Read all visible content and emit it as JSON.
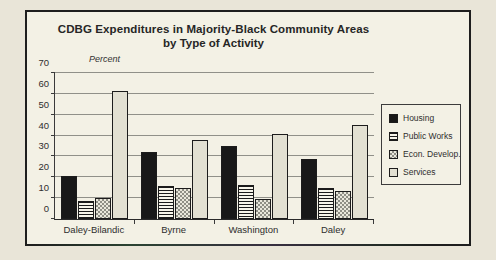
{
  "chart_data": {
    "type": "bar",
    "title": "CDBG Expenditures in Majority-Black Community Areas",
    "subtitle": "by Type of Activity",
    "ylabel": "Percent",
    "xlabel": "",
    "ylim": [
      0,
      70
    ],
    "yticks": [
      70,
      60,
      50,
      40,
      30,
      20,
      10,
      0
    ],
    "grid": "horizontal",
    "legend_position": "right",
    "categories": [
      "Daley-Bilandic",
      "Byrne",
      "Washington",
      "Daley"
    ],
    "series": [
      {
        "name": "Housing",
        "pattern": "solid-black",
        "values": [
          20.5,
          32,
          35,
          29
        ]
      },
      {
        "name": "Public Works",
        "pattern": "h-stripes",
        "values": [
          8.5,
          16,
          16.5,
          15
        ]
      },
      {
        "name": "Econ. Develop.",
        "pattern": "checker",
        "values": [
          10,
          15,
          9.5,
          13.5
        ]
      },
      {
        "name": "Services",
        "pattern": "light",
        "values": [
          61.5,
          38,
          41,
          45
        ]
      }
    ]
  },
  "colors": {
    "paper_outer": "#e9e5d8",
    "paper_inner": "#f3f1e5",
    "frame_border": "#1e1e1e",
    "gridline": "#6f6f6a",
    "bar_black": "#181818",
    "bar_light": "#e2e0d2",
    "checker_gray": "#8f8f86",
    "text": "#2b2b2b"
  }
}
